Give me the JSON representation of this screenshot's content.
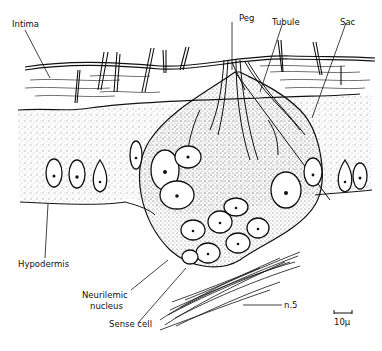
{
  "figure": {
    "labels": {
      "intima": "Intima",
      "peg": "Peg",
      "tubule": "Tubule",
      "sac": "Sac",
      "hypodermis": "Hypodermis",
      "neurilemic_nucleus_line1": "Neurilemic",
      "neurilemic_nucleus_line2": "nucleus",
      "sense_cell": "Sense cell",
      "nerve": "n.5",
      "scale_bar": "10μ"
    },
    "colors": {
      "ink": "#111111",
      "background": "#ffffff",
      "stipple": "#777777"
    }
  }
}
